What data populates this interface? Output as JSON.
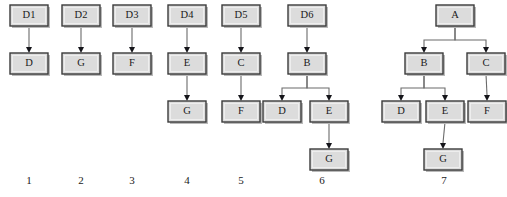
{
  "figure": {
    "background_color": "#ffffff",
    "node_fill_color": "#dcdcdc",
    "node_border_color": "#3b3b3b",
    "edge_color": "#6b6b6b",
    "arrowhead_color": "#15151a",
    "text_color": "#1a1a1a",
    "node_width": 38,
    "node_height": 21
  },
  "columns": [
    {
      "number": "1",
      "number_x": 29,
      "number_y": 181,
      "nodes": [
        {
          "id": "c1n1",
          "label": "D1",
          "x": 10,
          "y": 5
        },
        {
          "id": "c1n2",
          "label": "D",
          "x": 10,
          "y": 53
        }
      ],
      "edges": [
        {
          "from": "c1n1",
          "to": "c1n2",
          "type": "straight"
        }
      ]
    },
    {
      "number": "2",
      "number_x": 81,
      "number_y": 181,
      "nodes": [
        {
          "id": "c2n1",
          "label": "D2",
          "x": 62,
          "y": 5
        },
        {
          "id": "c2n2",
          "label": "G",
          "x": 62,
          "y": 53
        }
      ],
      "edges": [
        {
          "from": "c2n1",
          "to": "c2n2",
          "type": "straight"
        }
      ]
    },
    {
      "number": "3",
      "number_x": 132,
      "number_y": 181,
      "nodes": [
        {
          "id": "c3n1",
          "label": "D3",
          "x": 113,
          "y": 5
        },
        {
          "id": "c3n2",
          "label": "F",
          "x": 113,
          "y": 53
        }
      ],
      "edges": [
        {
          "from": "c3n1",
          "to": "c3n2",
          "type": "straight"
        }
      ]
    },
    {
      "number": "4",
      "number_x": 187,
      "number_y": 181,
      "nodes": [
        {
          "id": "c4n1",
          "label": "D4",
          "x": 168,
          "y": 5
        },
        {
          "id": "c4n2",
          "label": "E",
          "x": 168,
          "y": 53
        },
        {
          "id": "c4n3",
          "label": "G",
          "x": 168,
          "y": 101
        }
      ],
      "edges": [
        {
          "from": "c4n1",
          "to": "c4n2",
          "type": "straight"
        },
        {
          "from": "c4n2",
          "to": "c4n3",
          "type": "straight"
        }
      ]
    },
    {
      "number": "5",
      "number_x": 241,
      "number_y": 181,
      "nodes": [
        {
          "id": "c5n1",
          "label": "D5",
          "x": 222,
          "y": 5
        },
        {
          "id": "c5n2",
          "label": "C",
          "x": 222,
          "y": 53
        },
        {
          "id": "c5n3",
          "label": "F",
          "x": 222,
          "y": 101
        }
      ],
      "edges": [
        {
          "from": "c5n1",
          "to": "c5n2",
          "type": "straight"
        },
        {
          "from": "c5n2",
          "to": "c5n3",
          "type": "straight"
        }
      ]
    },
    {
      "number": "6",
      "number_x": 322,
      "number_y": 181,
      "nodes": [
        {
          "id": "c6n1",
          "label": "D6",
          "x": 288,
          "y": 5
        },
        {
          "id": "c6n2",
          "label": "B",
          "x": 288,
          "y": 53
        },
        {
          "id": "c6n3",
          "label": "D",
          "x": 263,
          "y": 101
        },
        {
          "id": "c6n4",
          "label": "E",
          "x": 310,
          "y": 101
        },
        {
          "id": "c6n5",
          "label": "G",
          "x": 310,
          "y": 149
        }
      ],
      "edges": [
        {
          "from": "c6n1",
          "to": "c6n2",
          "type": "straight"
        },
        {
          "from": "c6n2",
          "to": "c6n3",
          "type": "elbow",
          "elbow_y": 88
        },
        {
          "from": "c6n2",
          "to": "c6n4",
          "type": "elbow",
          "elbow_y": 88
        },
        {
          "from": "c6n4",
          "to": "c6n5",
          "type": "straight"
        }
      ]
    },
    {
      "number": "7",
      "number_x": 444,
      "number_y": 181,
      "nodes": [
        {
          "id": "c7n1",
          "label": "A",
          "x": 436,
          "y": 5
        },
        {
          "id": "c7n2",
          "label": "B",
          "x": 405,
          "y": 53
        },
        {
          "id": "c7n3",
          "label": "C",
          "x": 467,
          "y": 53
        },
        {
          "id": "c7n4",
          "label": "D",
          "x": 382,
          "y": 101
        },
        {
          "id": "c7n5",
          "label": "E",
          "x": 426,
          "y": 101
        },
        {
          "id": "c7n6",
          "label": "F",
          "x": 468,
          "y": 101
        },
        {
          "id": "c7n7",
          "label": "G",
          "x": 424,
          "y": 149
        }
      ],
      "edges": [
        {
          "from": "c7n1",
          "to": "c7n2",
          "type": "elbow",
          "elbow_y": 40
        },
        {
          "from": "c7n1",
          "to": "c7n3",
          "type": "elbow",
          "elbow_y": 40
        },
        {
          "from": "c7n2",
          "to": "c7n4",
          "type": "elbow",
          "elbow_y": 88
        },
        {
          "from": "c7n2",
          "to": "c7n5",
          "type": "elbow",
          "elbow_y": 88
        },
        {
          "from": "c7n3",
          "to": "c7n6",
          "type": "straight"
        },
        {
          "from": "c7n5",
          "to": "c7n7",
          "type": "straight"
        }
      ]
    }
  ]
}
